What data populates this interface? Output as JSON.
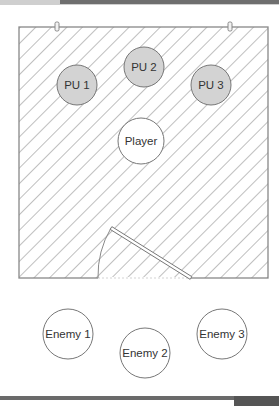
{
  "room": {
    "x": 19,
    "y": 27,
    "width": 249,
    "height": 251,
    "hatch_color": "#8a8a8a",
    "border_color": "#888888"
  },
  "markers": [
    {
      "x": 57,
      "y": 27
    },
    {
      "x": 230,
      "y": 27
    }
  ],
  "door": {
    "hinge": {
      "x": 191,
      "y": 278
    },
    "leaf_end": {
      "x": 111,
      "y": 228
    },
    "arc_end": {
      "x": 98,
      "y": 278
    }
  },
  "powerups": [
    {
      "label": "PU 1",
      "cx": 77,
      "cy": 85,
      "r": 20,
      "fill": "#d3d3d3"
    },
    {
      "label": "PU 2",
      "cx": 144,
      "cy": 67,
      "r": 20,
      "fill": "#d3d3d3"
    },
    {
      "label": "PU 3",
      "cx": 211,
      "cy": 85,
      "r": 20,
      "fill": "#d3d3d3"
    }
  ],
  "player": {
    "label": "Player",
    "cx": 141,
    "cy": 141,
    "r": 23,
    "fill": "#ffffff"
  },
  "enemies": [
    {
      "label": "Enemy 1",
      "cx": 68,
      "cy": 334,
      "r": 25
    },
    {
      "label": "Enemy 2",
      "cx": 145,
      "cy": 353,
      "r": 25
    },
    {
      "label": "Enemy 3",
      "cx": 222,
      "cy": 334,
      "r": 25
    }
  ]
}
